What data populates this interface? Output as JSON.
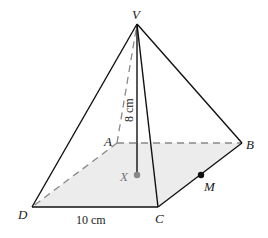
{
  "figure": {
    "type": "square-based pyramid",
    "vertices": {
      "apex": "V",
      "base": [
        "A",
        "B",
        "C",
        "D"
      ]
    },
    "labels": {
      "V": "V",
      "A": "A",
      "B": "B",
      "C": "C",
      "D": "D",
      "X": "X",
      "M": "M"
    },
    "dimensions": {
      "height": "8 cm",
      "base_edge": "10 cm"
    },
    "points": {
      "X": "centre of base (foot of perpendicular from V)",
      "M": "midpoint of edge BC"
    },
    "colors": {
      "edge": "#111111",
      "hidden_edge": "#888888",
      "base_fill": "#ececec",
      "point_X": "#888888",
      "point_M": "#111111"
    }
  }
}
